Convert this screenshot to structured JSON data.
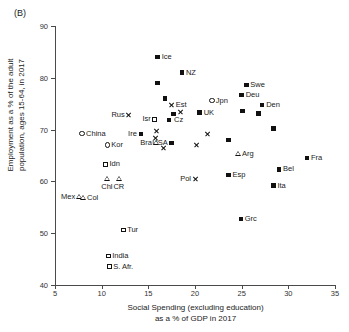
{
  "figure": {
    "panel_label": "(B)"
  },
  "chart_data": {
    "type": "scatter",
    "title": "",
    "xlabel": "Social Spending (excluding education)\nas a % of GDP in 2017",
    "xlabel_line1": "Social Spending (excluding education)",
    "xlabel_line2": "as a % of GDP in 2017",
    "ylabel_line1": "Employment as a % of the adult",
    "ylabel_line2": "population, ages 15-64, in 2017",
    "xlim": [
      5,
      35
    ],
    "ylim": [
      40,
      90
    ],
    "xticks": [
      5,
      10,
      15,
      20,
      25,
      30,
      35
    ],
    "yticks": [
      40,
      50,
      60,
      70,
      80,
      90
    ],
    "grid": false,
    "legend": "none",
    "marker_types": {
      "square": "filled-square",
      "circle": "open-circle",
      "osquare": "open-square",
      "triangle": "open-triangle",
      "cross": "x-cross"
    },
    "points": [
      {
        "label": "Ice",
        "x": 16.0,
        "y": 84.0,
        "marker": "square",
        "pos": "right"
      },
      {
        "label": "NZ",
        "x": 18.6,
        "y": 81.0,
        "marker": "square",
        "pos": "right"
      },
      {
        "label": "",
        "x": 16.0,
        "y": 79.0,
        "marker": "square",
        "pos": "right"
      },
      {
        "label": "Swe",
        "x": 25.5,
        "y": 78.6,
        "marker": "square",
        "pos": "right"
      },
      {
        "label": "Deu",
        "x": 25.0,
        "y": 76.7,
        "marker": "square",
        "pos": "right"
      },
      {
        "label": "",
        "x": 16.8,
        "y": 76.0,
        "marker": "square",
        "pos": "right"
      },
      {
        "label": "Jpn",
        "x": 21.8,
        "y": 75.6,
        "marker": "circle",
        "pos": "right"
      },
      {
        "label": "Est",
        "x": 17.5,
        "y": 74.8,
        "marker": "cross",
        "pos": "right"
      },
      {
        "label": "Den",
        "x": 27.2,
        "y": 74.8,
        "marker": "square",
        "pos": "right"
      },
      {
        "label": "",
        "x": 25.1,
        "y": 73.6,
        "marker": "square",
        "pos": "right"
      },
      {
        "label": "UK",
        "x": 20.5,
        "y": 73.3,
        "marker": "square",
        "pos": "right"
      },
      {
        "label": "Cz",
        "x": 18.4,
        "y": 73.4,
        "marker": "cross",
        "pos": "below"
      },
      {
        "label": "",
        "x": 26.8,
        "y": 73.1,
        "marker": "square",
        "pos": "right"
      },
      {
        "label": "Rus",
        "x": 12.9,
        "y": 72.8,
        "marker": "cross",
        "pos": "left"
      },
      {
        "label": "",
        "x": 17.7,
        "y": 73.0,
        "marker": "square",
        "pos": "right"
      },
      {
        "label": "Isr",
        "x": 15.7,
        "y": 72.0,
        "marker": "osquare",
        "pos": "left"
      },
      {
        "label": "",
        "x": 17.2,
        "y": 71.8,
        "marker": "square",
        "pos": "right"
      },
      {
        "label": "",
        "x": 28.4,
        "y": 70.2,
        "marker": "square",
        "pos": "right"
      },
      {
        "label": "",
        "x": 15.9,
        "y": 69.7,
        "marker": "cross",
        "pos": "right"
      },
      {
        "label": "China",
        "x": 7.9,
        "y": 69.2,
        "marker": "circle",
        "pos": "right"
      },
      {
        "label": "Ire",
        "x": 14.2,
        "y": 69.2,
        "marker": "square",
        "pos": "left"
      },
      {
        "label": "",
        "x": 21.3,
        "y": 69.1,
        "marker": "cross",
        "pos": "right"
      },
      {
        "label": "",
        "x": 23.6,
        "y": 68.0,
        "marker": "square",
        "pos": "right"
      },
      {
        "label": "USA",
        "x": 17.5,
        "y": 67.4,
        "marker": "square",
        "pos": "left"
      },
      {
        "label": "Bra",
        "x": 15.8,
        "y": 67.4,
        "marker": "triangle",
        "pos": "left"
      },
      {
        "label": "",
        "x": 15.8,
        "y": 68.3,
        "marker": "cross",
        "pos": "right"
      },
      {
        "label": "Kor",
        "x": 10.6,
        "y": 67.0,
        "marker": "circle",
        "pos": "right"
      },
      {
        "label": "",
        "x": 20.2,
        "y": 67.0,
        "marker": "cross",
        "pos": "right"
      },
      {
        "label": "",
        "x": 16.6,
        "y": 66.4,
        "marker": "cross",
        "pos": "right"
      },
      {
        "label": "Arg",
        "x": 24.6,
        "y": 65.3,
        "marker": "triangle",
        "pos": "right"
      },
      {
        "label": "Fra",
        "x": 32.0,
        "y": 64.5,
        "marker": "square",
        "pos": "right"
      },
      {
        "label": "Idn",
        "x": 10.4,
        "y": 63.3,
        "marker": "osquare",
        "pos": "right"
      },
      {
        "label": "Bel",
        "x": 29.0,
        "y": 62.3,
        "marker": "square",
        "pos": "right"
      },
      {
        "label": "Esp",
        "x": 23.6,
        "y": 61.2,
        "marker": "square",
        "pos": "right"
      },
      {
        "label": "Pol",
        "x": 20.0,
        "y": 60.5,
        "marker": "cross",
        "pos": "left"
      },
      {
        "label": "Chl",
        "x": 10.6,
        "y": 60.5,
        "marker": "triangle",
        "pos": "below"
      },
      {
        "label": "CR",
        "x": 11.9,
        "y": 60.5,
        "marker": "triangle",
        "pos": "below"
      },
      {
        "label": "Ita",
        "x": 28.4,
        "y": 59.2,
        "marker": "square",
        "pos": "right"
      },
      {
        "label": "Mex",
        "x": 7.6,
        "y": 57.0,
        "marker": "triangle",
        "pos": "left"
      },
      {
        "label": "Col",
        "x": 8.0,
        "y": 56.8,
        "marker": "triangle",
        "pos": "right"
      },
      {
        "label": "Grc",
        "x": 24.9,
        "y": 52.8,
        "marker": "square",
        "pos": "right"
      },
      {
        "label": "Tur",
        "x": 12.3,
        "y": 50.6,
        "marker": "osquare",
        "pos": "right"
      },
      {
        "label": "India",
        "x": 10.7,
        "y": 45.6,
        "marker": "osquare",
        "pos": "right"
      },
      {
        "label": "S. Afr.",
        "x": 10.8,
        "y": 43.5,
        "marker": "osquare",
        "pos": "right"
      }
    ]
  }
}
